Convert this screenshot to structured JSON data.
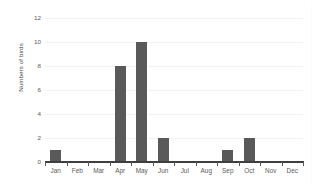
{
  "chart_data": {
    "type": "bar",
    "title": "",
    "xlabel": "",
    "ylabel": "Numbers of birds",
    "categories": [
      "Jan",
      "Feb",
      "Mar",
      "Apr",
      "May",
      "Jun",
      "Jul",
      "Aug",
      "Sep",
      "Oct",
      "Nov",
      "Dec"
    ],
    "values": [
      1,
      0,
      0,
      8,
      10,
      2,
      0,
      0,
      1,
      2,
      0,
      0
    ],
    "ylim": [
      0,
      12
    ],
    "ytick_labels": [
      "12",
      "10",
      "8",
      "6",
      "4",
      "2",
      "0"
    ],
    "ytick_values": [
      12,
      10,
      8,
      6,
      4,
      2,
      0
    ],
    "ytick_step": 2,
    "grid": true,
    "grid_axis": "y",
    "legend": false,
    "legend_position": "none",
    "bar_color": "#595959",
    "gridline_color": "#F2F2F2",
    "axis_color": "#3F3F3F",
    "tick_text_color": "#595959",
    "background_color": "#FFFFFF"
  }
}
